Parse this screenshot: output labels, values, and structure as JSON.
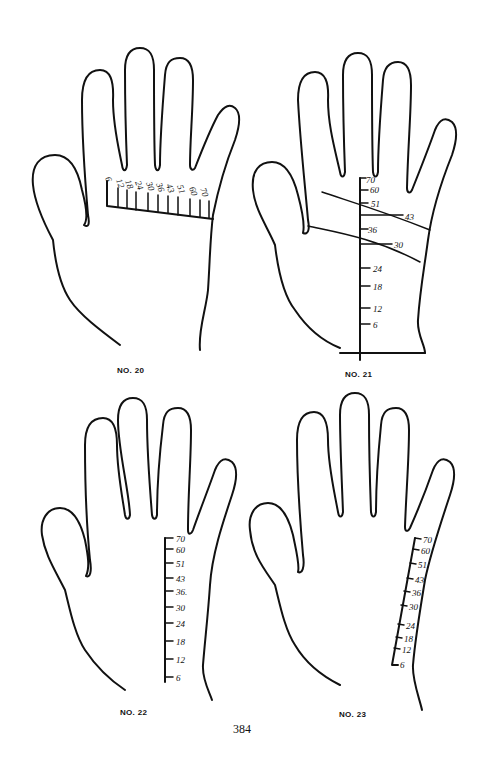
{
  "page": {
    "number": "384",
    "ink_color": "#111111",
    "background": "#ffffff"
  },
  "figures": [
    {
      "caption": "NO. 20",
      "scale_orientation": "horizontal across base of fingers",
      "scale_labels": [
        "6",
        "12",
        "18",
        "24",
        "30",
        "36",
        "43",
        "51",
        "60",
        "70"
      ]
    },
    {
      "caption": "NO. 21",
      "scale_orientation": "vertical center of palm with two crossing lines",
      "scale_labels": [
        "70",
        "60",
        "51",
        "43",
        "36",
        "30",
        "24",
        "18",
        "12",
        "6"
      ],
      "crossing_line_labels": [
        "43",
        "30"
      ]
    },
    {
      "caption": "NO. 22",
      "scale_orientation": "vertical below little finger",
      "scale_labels": [
        "70",
        "60",
        "51",
        "43",
        "36.",
        "30",
        "24",
        "18",
        "12",
        "6"
      ]
    },
    {
      "caption": "NO. 23",
      "scale_orientation": "slanted along percussion edge",
      "scale_labels": [
        "70",
        "60",
        "51",
        "43",
        "36",
        "30",
        "24",
        "18",
        "12",
        "6"
      ]
    }
  ]
}
